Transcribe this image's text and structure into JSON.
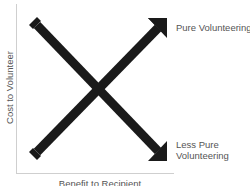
{
  "diagram": {
    "y_axis_label": "Cost to Volunteer",
    "x_axis_label": "Benefit to Recipient",
    "arrows": [
      {
        "name": "rising",
        "from": "low-cost, low-benefit",
        "to": "high-cost, high-benefit",
        "label": "Pure Volunteering"
      },
      {
        "name": "falling",
        "from": "high-cost, low-benefit",
        "to": "low-cost, high-benefit",
        "label_line1": "Less Pure",
        "label_line2": "Volunteering"
      }
    ],
    "colors": {
      "arrow": "#1a1a1a",
      "axis": "#cfcfcf",
      "text": "#555555"
    }
  }
}
